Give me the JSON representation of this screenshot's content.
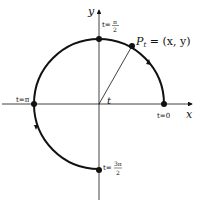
{
  "diagram": {
    "axes": {
      "x_label": "x",
      "y_label": "y"
    },
    "point_label": "P",
    "point_subscript": "t",
    "point_coords": " = (x, y)",
    "angle_label": "t",
    "markers": [
      {
        "label": "t=0"
      },
      {
        "label_prefix": "t=",
        "num": "π",
        "den": "2"
      },
      {
        "label": "t=π"
      },
      {
        "label_prefix": "t=",
        "num": "3π",
        "den": "2"
      }
    ],
    "colors": {
      "stroke": "#111111",
      "background": "#ffffff"
    }
  }
}
